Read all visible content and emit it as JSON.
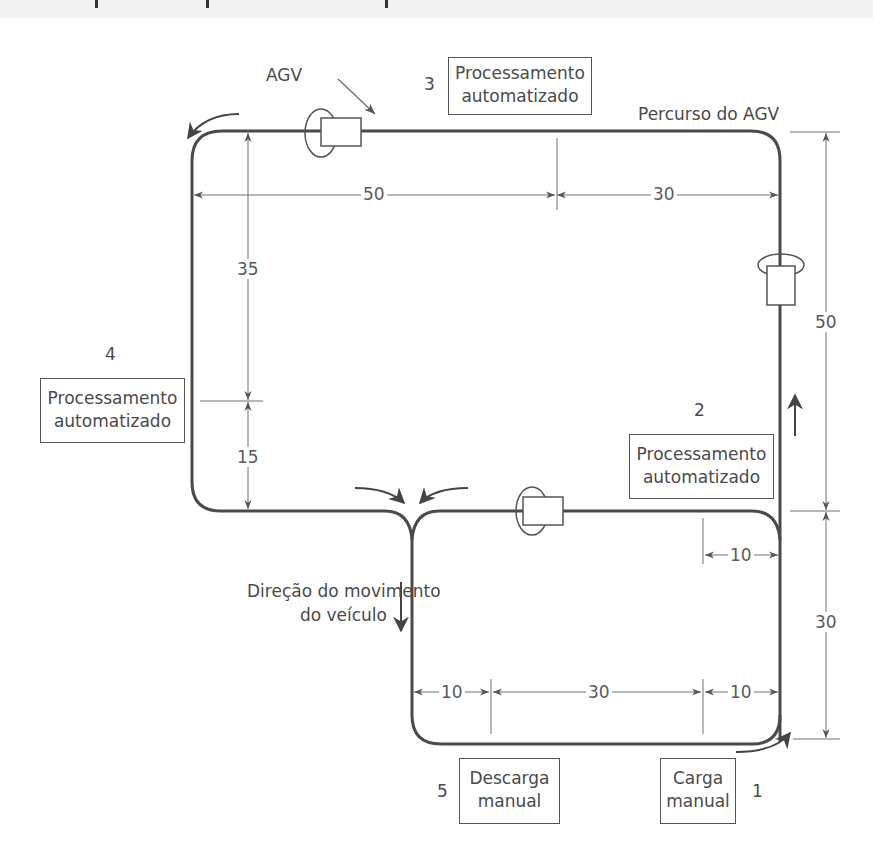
{
  "diagram": {
    "title_fragment_visible": "",
    "path_label": "Percurso do AGV",
    "agv_label": "AGV",
    "direction_label": [
      "Direção do movimento",
      "do veículo"
    ],
    "stations": [
      {
        "number": "1",
        "lines": [
          "Carga",
          "manual"
        ]
      },
      {
        "number": "2",
        "lines": [
          "Processamento",
          "automatizado"
        ]
      },
      {
        "number": "3",
        "lines": [
          "Processamento",
          "automatizado"
        ]
      },
      {
        "number": "4",
        "lines": [
          "Processamento",
          "automatizado"
        ]
      },
      {
        "number": "5",
        "lines": [
          "Descarga",
          "manual"
        ]
      }
    ],
    "dimensions": {
      "top_left": "50",
      "top_right": "30",
      "left_upper": "35",
      "left_lower": "15",
      "right_upper": "50",
      "right_lower": "30",
      "inner_right": "10",
      "bottom_left": "10",
      "bottom_middle": "30",
      "bottom_right": "10"
    },
    "colors": {
      "line": "#4a4a4a",
      "dim_line": "#707070",
      "background": "#ffffff"
    }
  }
}
